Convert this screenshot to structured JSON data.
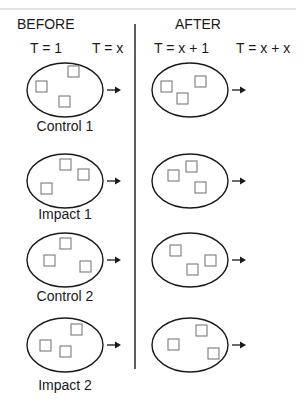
{
  "headers": {
    "before": "BEFORE",
    "after": "AFTER"
  },
  "time_labels": [
    "T = 1",
    "T = x",
    "T = x + 1",
    "T = x + x"
  ],
  "groups": [
    {
      "label": "Control 1",
      "before_squares": [
        [
          -29,
          -9
        ],
        [
          3,
          -24
        ],
        [
          -6,
          6
        ]
      ],
      "after_squares": [
        [
          -29,
          -9
        ],
        [
          5,
          -14
        ],
        [
          -13,
          3
        ]
      ]
    },
    {
      "label": "Impact 1",
      "before_squares": [
        [
          -24,
          2
        ],
        [
          -5,
          -22
        ],
        [
          13,
          -12
        ]
      ],
      "after_squares": [
        [
          -22,
          -11
        ],
        [
          -4,
          -20
        ],
        [
          5,
          1
        ]
      ]
    },
    {
      "label": "Control 2",
      "before_squares": [
        [
          -21,
          -5
        ],
        [
          -5,
          -22
        ],
        [
          15,
          1
        ]
      ],
      "after_squares": [
        [
          -20,
          -15
        ],
        [
          15,
          -5
        ],
        [
          -3,
          4
        ]
      ]
    },
    {
      "label": "Impact 2",
      "before_squares": [
        [
          -25,
          -5
        ],
        [
          6,
          -21
        ],
        [
          -5,
          1
        ]
      ],
      "after_squares": [
        [
          -22,
          -6
        ],
        [
          6,
          -20
        ],
        [
          18,
          3
        ]
      ]
    }
  ],
  "colors": {
    "ink": "#1a1a1a",
    "square_stroke": "#7a7a7a",
    "rule": "#c8c8c8"
  }
}
